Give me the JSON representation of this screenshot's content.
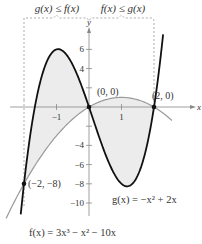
{
  "bracket": {
    "left_label": "g(x) ≤ f(x)",
    "right_label": "f(x) ≤ g(x)"
  },
  "axes": {
    "x_label": "x",
    "y_label": "y",
    "x_ticks": [
      {
        "value": -1,
        "label": "−1"
      },
      {
        "value": 1,
        "label": "1"
      }
    ],
    "y_ticks": [
      {
        "value": 6,
        "label": "6"
      },
      {
        "value": 4,
        "label": "4"
      },
      {
        "value": 2,
        "label": ""
      },
      {
        "value": -2,
        "label": ""
      },
      {
        "value": -4,
        "label": "−4"
      },
      {
        "value": -6,
        "label": "−6"
      },
      {
        "value": -8,
        "label": "−8"
      },
      {
        "value": -10,
        "label": "−10"
      }
    ]
  },
  "points": [
    {
      "x": 0,
      "y": 0,
      "label": "(0, 0)"
    },
    {
      "x": 2,
      "y": 0,
      "label": "(2, 0)"
    },
    {
      "x": -2,
      "y": -8,
      "label": "(−2, −8)"
    }
  ],
  "equations": {
    "g": "g(x) = −x² + 2x",
    "f": "f(x) = 3x³ − x² − 10x"
  },
  "colors": {
    "f_curve": "#111111",
    "g_curve": "#9a9a9a",
    "shade": "#ececec",
    "axis": "#888888",
    "bracket": "#999999"
  },
  "chart_data": {
    "type": "line",
    "title": "",
    "xlabel": "x",
    "ylabel": "y",
    "xlim": [
      -2.6,
      2.6
    ],
    "ylim": [
      -11.5,
      9.5
    ],
    "grid": false,
    "series": [
      {
        "name": "f(x) = 3x³ − x² − 10x",
        "expr": "3x^3 - x^2 - 10x",
        "domain": [
          -2.1,
          2.28
        ]
      },
      {
        "name": "g(x) = −x² + 2x",
        "expr": "-x^2 + 2x",
        "domain": [
          -2.55,
          2.55
        ]
      }
    ],
    "shaded_regions": [
      {
        "between": [
          "f",
          "g"
        ],
        "x_range": [
          -2,
          0
        ],
        "note": "g(x) ≤ f(x)"
      },
      {
        "between": [
          "g",
          "f"
        ],
        "x_range": [
          0,
          2
        ],
        "note": "f(x) ≤ g(x)"
      }
    ],
    "intersections": [
      [
        -2,
        -8
      ],
      [
        0,
        0
      ],
      [
        2,
        0
      ]
    ]
  }
}
